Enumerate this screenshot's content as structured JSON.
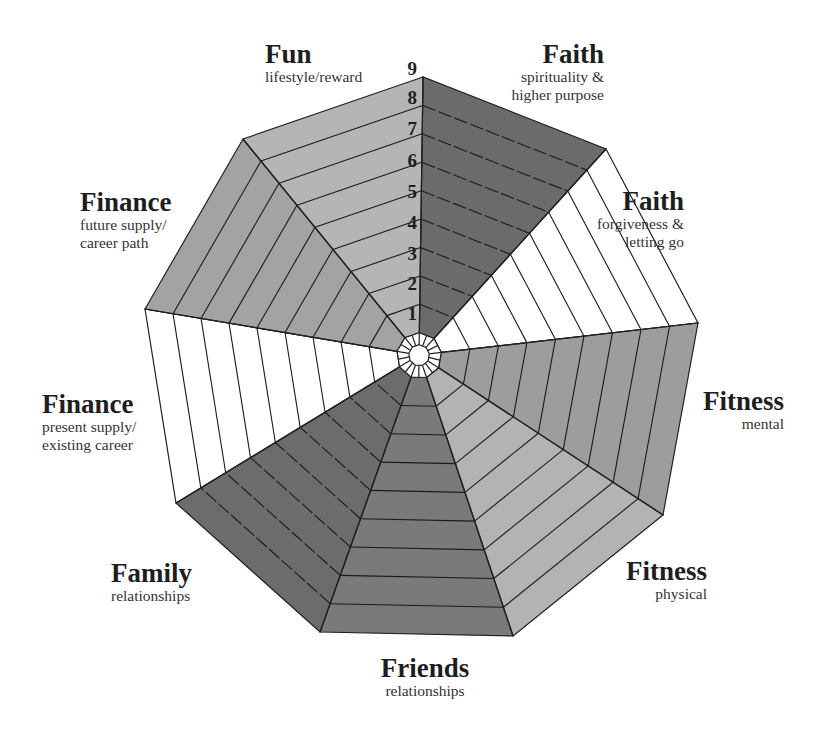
{
  "diagram": {
    "type": "life-balance-wheel",
    "center": [
      419,
      355
    ],
    "inner_radius_fraction": 0.037,
    "white_ring_fraction": 0.08,
    "rings": 9,
    "ring_numbers": [
      "1",
      "2",
      "3",
      "4",
      "5",
      "6",
      "7",
      "8",
      "9"
    ],
    "outer_vertices": [
      [
        423,
        77
      ],
      [
        606,
        149
      ],
      [
        698,
        323
      ],
      [
        663,
        515
      ],
      [
        513,
        636
      ],
      [
        320,
        632
      ],
      [
        176,
        503
      ],
      [
        145,
        309
      ],
      [
        243,
        139
      ]
    ],
    "sectors": [
      {
        "id": "faith-spirituality",
        "title": "Faith",
        "subtitle": [
          "spirituality &",
          "higher purpose"
        ],
        "fill": "#6b6b6b",
        "dashed": true
      },
      {
        "id": "faith-forgiveness",
        "title": "Faith",
        "subtitle": [
          "forgiveness &",
          "letting go"
        ],
        "fill": "#ffffff",
        "dashed": false
      },
      {
        "id": "fitness-mental",
        "title": "Fitness",
        "subtitle": [
          "mental"
        ],
        "fill": "#9d9d9d",
        "dashed": false
      },
      {
        "id": "fitness-physical",
        "title": "Fitness",
        "subtitle": [
          "physical"
        ],
        "fill": "#b3b3b3",
        "dashed": false
      },
      {
        "id": "friends",
        "title": "Friends",
        "subtitle": [
          "relationships"
        ],
        "fill": "#7a7a7a",
        "dashed": false
      },
      {
        "id": "family",
        "title": "Family",
        "subtitle": [
          "relationships"
        ],
        "fill": "#6c6c6c",
        "dashed": true
      },
      {
        "id": "finance-present",
        "title": "Finance",
        "subtitle": [
          "present supply/",
          "existing career"
        ],
        "fill": "#ffffff",
        "dashed": false
      },
      {
        "id": "finance-future",
        "title": "Finance",
        "subtitle": [
          "future supply/",
          "career path"
        ],
        "fill": "#a3a3a3",
        "dashed": false
      },
      {
        "id": "fun",
        "title": "Fun",
        "subtitle": [
          "lifestyle/reward"
        ],
        "fill": "#b5b5b5",
        "dashed": false
      }
    ]
  },
  "labels": {
    "fun": {
      "title": "Fun",
      "sub1": "lifestyle/reward"
    },
    "faith_spirituality": {
      "title": "Faith",
      "sub1": "spirituality &",
      "sub2": "higher purpose"
    },
    "faith_forgiveness": {
      "title": "Faith",
      "sub1": "forgiveness &",
      "sub2": "letting go"
    },
    "fitness_mental": {
      "title": "Fitness",
      "sub1": "mental"
    },
    "fitness_physical": {
      "title": "Fitness",
      "sub1": "physical"
    },
    "friends": {
      "title": "Friends",
      "sub1": "relationships"
    },
    "family": {
      "title": "Family",
      "sub1": "relationships"
    },
    "finance_present": {
      "title": "Finance",
      "sub1": "present supply/",
      "sub2": "existing career"
    },
    "finance_future": {
      "title": "Finance",
      "sub1": "future supply/",
      "sub2": "career path"
    }
  },
  "scale": {
    "n1": "1",
    "n2": "2",
    "n3": "3",
    "n4": "4",
    "n5": "5",
    "n6": "6",
    "n7": "7",
    "n8": "8",
    "n9": "9"
  }
}
